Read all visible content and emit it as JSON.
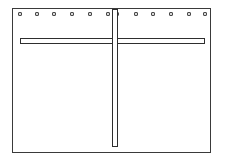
{
  "figure": {
    "title": "",
    "caption": "",
    "background_color": "#ffffff",
    "line_color": "#2e2e2e"
  },
  "panel": {
    "name": "rectangular panel frame",
    "border_color": "#3a3a3a",
    "fill_color": "#ffffff",
    "label": ""
  },
  "grommets": {
    "count": 12,
    "fill_color": "#d8d8d8",
    "outline_color": "#4a4a4a",
    "positions_percent": [
      4,
      12.5,
      21,
      30,
      39,
      48,
      53,
      62.5,
      71,
      80,
      89,
      97
    ],
    "items": [
      {
        "index": 1,
        "label": ""
      },
      {
        "index": 2,
        "label": ""
      },
      {
        "index": 3,
        "label": ""
      },
      {
        "index": 4,
        "label": ""
      },
      {
        "index": 5,
        "label": ""
      },
      {
        "index": 6,
        "label": ""
      },
      {
        "index": 7,
        "label": ""
      },
      {
        "index": 8,
        "label": ""
      },
      {
        "index": 9,
        "label": ""
      },
      {
        "index": 10,
        "label": ""
      },
      {
        "index": 11,
        "label": ""
      },
      {
        "index": 12,
        "label": ""
      }
    ]
  },
  "horizontal_rail": {
    "name": "horizontal rail",
    "label": "",
    "color": "#2e2e2e"
  },
  "vertical_rail": {
    "name": "vertical rail",
    "label": "",
    "color": "#2e2e2e"
  }
}
